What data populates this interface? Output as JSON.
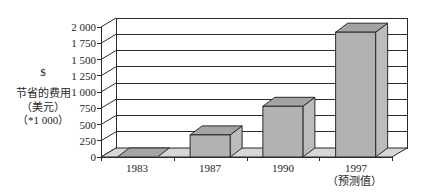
{
  "chart_data": {
    "type": "bar",
    "style": "3d-column",
    "title": "",
    "xlabel": "",
    "ylabel": [
      "$",
      "节省的费用",
      "（美元）",
      "（*1 000）"
    ],
    "categories": [
      "1983",
      "1987",
      "1990",
      "1997"
    ],
    "category_sublabels": [
      "",
      "",
      "",
      "（预测值）"
    ],
    "values": [
      0,
      340,
      780,
      1920
    ],
    "ylim": [
      0,
      2000
    ],
    "yticks": [
      0,
      250,
      500,
      750,
      1000,
      1250,
      1500,
      1750,
      2000
    ],
    "ytick_labels": [
      "0",
      "250",
      "500",
      "750",
      "1 000",
      "1 250",
      "1 500",
      "1 750",
      "2 000"
    ],
    "grid": true,
    "legend": null
  },
  "colors": {
    "line": "#2a2a2a",
    "floor": "#d6d6d6",
    "back_wall": "#ffffff",
    "bar_front": "#b2b2b2",
    "bar_top": "#a4a4a4",
    "bar_side": "#bcbcbc",
    "bar_flat": "#a6a6a6"
  }
}
